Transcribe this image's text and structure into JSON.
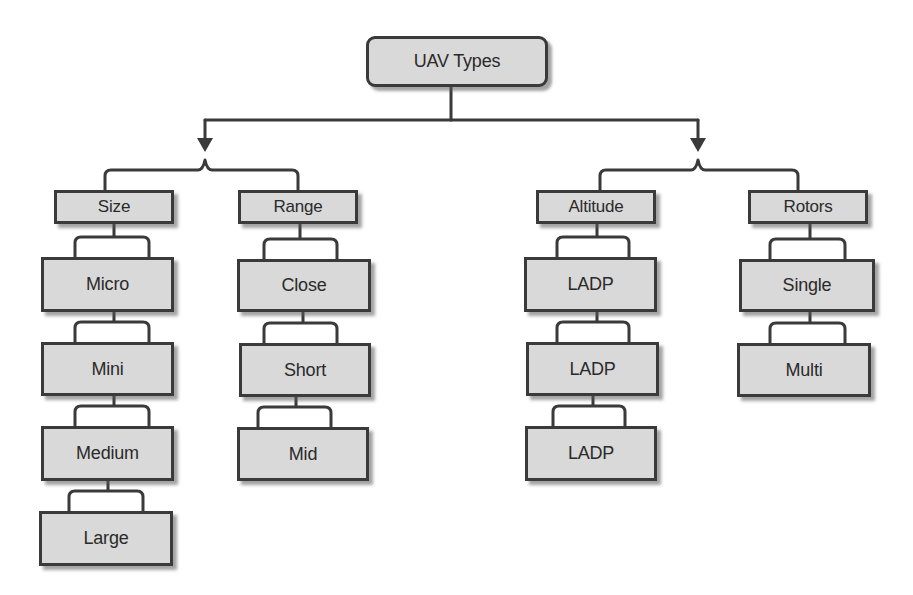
{
  "diagram": {
    "type": "hierarchy",
    "title": "UAV Types",
    "colors": {
      "box_fill": "#d9d9d9",
      "box_border": "#3a3a3a",
      "line": "#3a3a3a",
      "text": "#2a2a2a"
    },
    "root": {
      "label": "UAV Types"
    },
    "categories": [
      {
        "label": "Size",
        "children": [
          "Micro",
          "Mini",
          "Medium",
          "Large"
        ]
      },
      {
        "label": "Range",
        "children": [
          "Close",
          "Short",
          "Mid"
        ]
      },
      {
        "label": "Altitude",
        "children": [
          "LADP",
          "LADP",
          "LADP"
        ]
      },
      {
        "label": "Rotors",
        "children": [
          "Single",
          "Multi"
        ]
      }
    ]
  }
}
